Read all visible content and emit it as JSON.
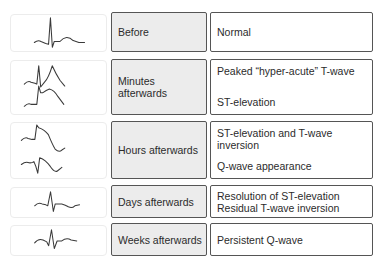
{
  "rows": [
    {
      "stage": "Before",
      "findings": [
        "Normal"
      ],
      "ecg_traces": [
        "normal-ecg"
      ]
    },
    {
      "stage": "Minutes afterwards",
      "findings": [
        "Peaked “hyper-acute” T-wave",
        "ST-elevation"
      ],
      "ecg_traces": [
        "hyperacute-t-wave-ecg",
        "st-elevation-ecg"
      ]
    },
    {
      "stage": "Hours afterwards",
      "findings": [
        "ST-elevation and T-wave inversion",
        "Q-wave appearance"
      ],
      "ecg_traces": [
        "st-elevation-t-inversion-ecg",
        "q-wave-ecg"
      ]
    },
    {
      "stage": "Days afterwards",
      "findings": [
        "Resolution of ST-elevation",
        "Residual T-wave inversion"
      ],
      "ecg_traces": [
        "residual-t-inversion-ecg"
      ]
    },
    {
      "stage": "Weeks afterwards",
      "findings": [
        "Persistent Q-wave"
      ],
      "ecg_traces": [
        "persistent-q-wave-ecg"
      ]
    }
  ]
}
